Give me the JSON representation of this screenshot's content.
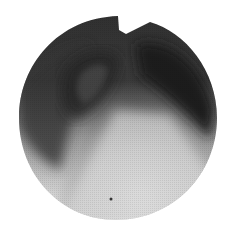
{
  "image": {
    "description": "Circular fluoroscopic X-ray field of view showing a dark region at top and a bright gradient toward the bottom, with a notch at the top edge and a small dark dot near the bottom",
    "background_color": "#ffffff",
    "tones": {
      "dark": "#1e1e1e",
      "mid_dark": "#3c3c3c",
      "mid": "#7a7a7a",
      "light": "#c8c8c8",
      "lightest": "#e4e4e4"
    },
    "marker": "dot-marker"
  }
}
